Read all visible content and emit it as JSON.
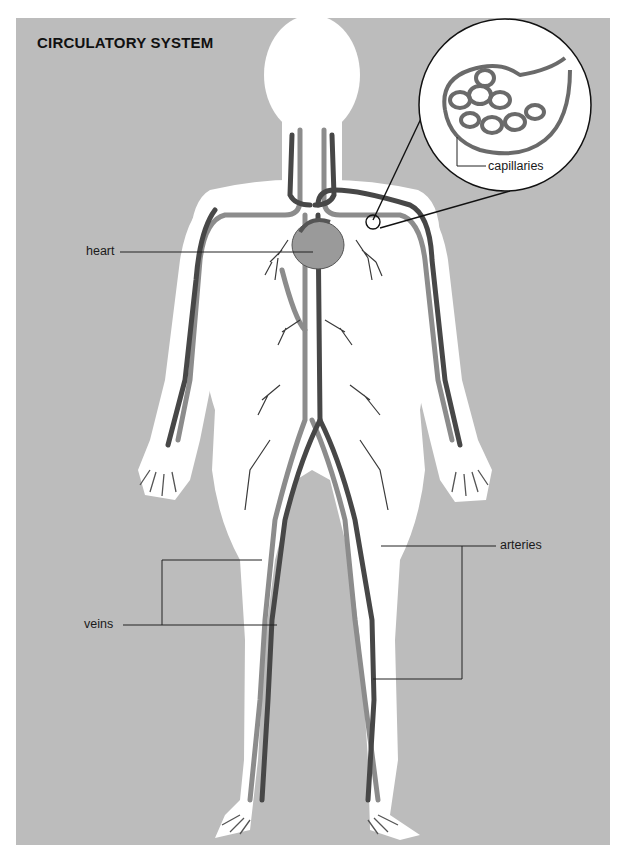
{
  "title": "CIRCULATORY SYSTEM",
  "colors": {
    "background_panel": "#bcbcbc",
    "page": "#ffffff",
    "body_silhouette": "#ffffff",
    "vein": "#8a8a8a",
    "artery": "#4a4a4a",
    "leader_line": "#222222"
  },
  "labels": {
    "heart": "heart",
    "capillaries": "capillaries",
    "veins": "veins",
    "arteries": "arteries"
  },
  "inset": {
    "name": "capillaries magnified view",
    "shape": "circle"
  }
}
